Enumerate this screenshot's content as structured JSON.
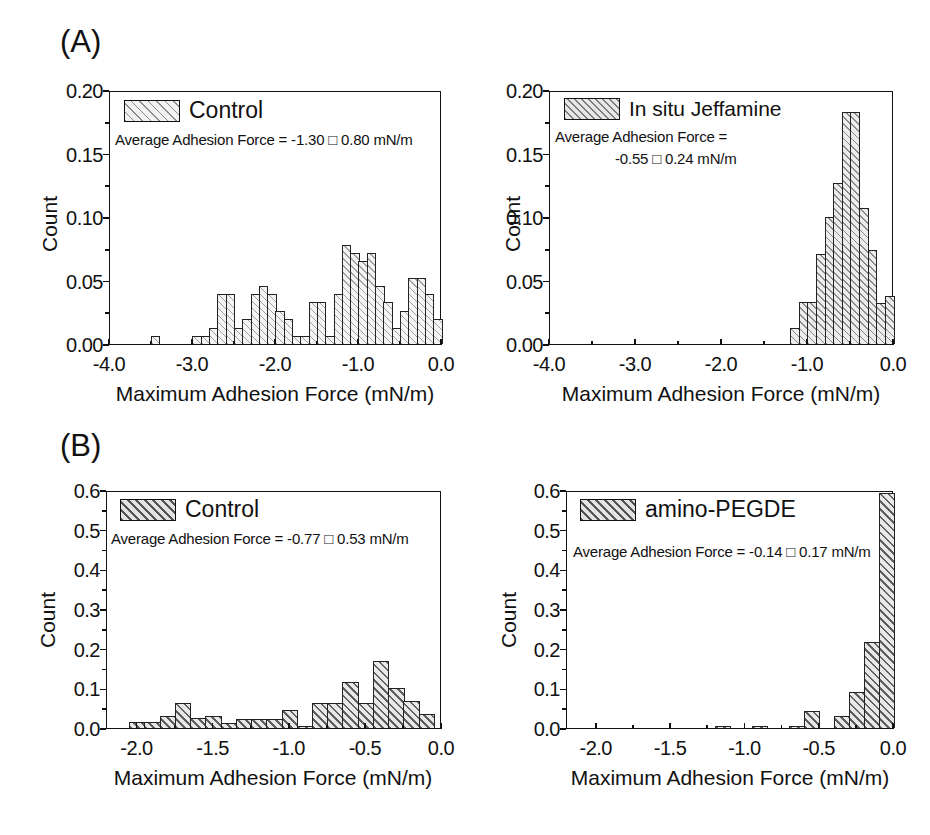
{
  "figure": {
    "panel_a_letter": "(A)",
    "panel_b_letter": "(B)"
  },
  "chart_data": [
    {
      "id": "a-left",
      "type": "bar",
      "title": "",
      "xlabel": "Maximum Adhesion Force (mN/m)",
      "ylabel": "Count",
      "xlim": [
        -4.0,
        0.0
      ],
      "ylim": [
        0.0,
        0.2
      ],
      "xticks": [
        "-4.0",
        "-3.0",
        "-2.0",
        "-1.0",
        "0.0"
      ],
      "xtick_values": [
        -4.0,
        -3.0,
        -2.0,
        -1.0,
        0.0
      ],
      "yticks": [
        "0.00",
        "0.05",
        "0.10",
        "0.15",
        "0.20"
      ],
      "ytick_values": [
        0.0,
        0.05,
        0.1,
        0.15,
        0.2
      ],
      "grid": false,
      "legend_position": "top-left",
      "legend": "Control",
      "annotation": "Average Adhesion Force = -1.30 □ 0.80 mN/m",
      "annotation_line2": "",
      "mean": -1.3,
      "std": 0.8,
      "bin_width": 0.1,
      "bin_left_edges": [
        -3.5,
        -3.0,
        -2.9,
        -2.8,
        -2.7,
        -2.6,
        -2.5,
        -2.4,
        -2.3,
        -2.2,
        -2.1,
        -2.0,
        -1.9,
        -1.8,
        -1.7,
        -1.6,
        -1.5,
        -1.4,
        -1.3,
        -1.2,
        -1.1,
        -1.0,
        -0.9,
        -0.8,
        -0.7,
        -0.6,
        -0.5,
        -0.4,
        -0.3,
        -0.2,
        -0.1
      ],
      "values": [
        0.006,
        0.006,
        0.006,
        0.013,
        0.039,
        0.039,
        0.013,
        0.02,
        0.039,
        0.046,
        0.039,
        0.026,
        0.02,
        0.006,
        0.006,
        0.033,
        0.033,
        0.006,
        0.039,
        0.078,
        0.072,
        0.065,
        0.072,
        0.046,
        0.033,
        0.013,
        0.026,
        0.052,
        0.052,
        0.039,
        0.02
      ]
    },
    {
      "id": "a-right",
      "type": "bar",
      "title": "",
      "xlabel": "Maximum Adhesion Force (mN/m)",
      "ylabel": "Count",
      "xlim": [
        -4.0,
        0.0
      ],
      "ylim": [
        0.0,
        0.2
      ],
      "xticks": [
        "-4.0",
        "-3.0",
        "-2.0",
        "-1.0",
        "0.0"
      ],
      "xtick_values": [
        -4.0,
        -3.0,
        -2.0,
        -1.0,
        0.0
      ],
      "yticks": [
        "0.00",
        "0.05",
        "0.10",
        "0.15",
        "0.20"
      ],
      "ytick_values": [
        0.0,
        0.05,
        0.1,
        0.15,
        0.2
      ],
      "grid": false,
      "legend_position": "top-left",
      "legend": "In situ Jeffamine",
      "annotation": "Average Adhesion Force =",
      "annotation_line2": "-0.55 □ 0.24 mN/m",
      "mean": -0.55,
      "std": 0.24,
      "bin_width": 0.1,
      "bin_left_edges": [
        -1.2,
        -1.1,
        -1.0,
        -0.9,
        -0.8,
        -0.7,
        -0.6,
        -0.5,
        -0.4,
        -0.3,
        -0.2,
        -0.1
      ],
      "values": [
        0.013,
        0.033,
        0.033,
        0.071,
        0.1,
        0.127,
        0.183,
        0.183,
        0.107,
        0.074,
        0.032,
        0.038
      ]
    },
    {
      "id": "b-left",
      "type": "bar",
      "title": "",
      "xlabel": "Maximum Adhesion Force (mN/m)",
      "ylabel": "Count",
      "xlim": [
        -2.2,
        0.0
      ],
      "ylim": [
        0.0,
        0.6
      ],
      "xticks": [
        "-2.0",
        "-1.5",
        "-1.0",
        "-0.5",
        "0.0"
      ],
      "xtick_values": [
        -2.0,
        -1.5,
        -1.0,
        -0.5,
        0.0
      ],
      "yticks": [
        "0.0",
        "0.1",
        "0.2",
        "0.3",
        "0.4",
        "0.5",
        "0.6"
      ],
      "ytick_values": [
        0.0,
        0.1,
        0.2,
        0.3,
        0.4,
        0.5,
        0.6
      ],
      "grid": false,
      "legend_position": "top-left",
      "legend": "Control",
      "annotation": "Average Adhesion Force = -0.77 □ 0.53 mN/m",
      "annotation_line2": "",
      "mean": -0.77,
      "std": 0.53,
      "bin_width": 0.1,
      "bin_left_edges": [
        -2.05,
        -1.95,
        -1.85,
        -1.75,
        -1.65,
        -1.55,
        -1.45,
        -1.35,
        -1.25,
        -1.15,
        -1.05,
        -0.95,
        -0.85,
        -0.75,
        -0.65,
        -0.55,
        -0.45,
        -0.35,
        -0.25,
        -0.15
      ],
      "values": [
        0.015,
        0.015,
        0.03,
        0.062,
        0.025,
        0.03,
        0.013,
        0.022,
        0.022,
        0.022,
        0.046,
        0.005,
        0.062,
        0.062,
        0.116,
        0.062,
        0.17,
        0.1,
        0.069,
        0.035
      ]
    },
    {
      "id": "b-right",
      "type": "bar",
      "title": "",
      "xlabel": "Maximum Adhesion Force (mN/m)",
      "ylabel": "Count",
      "xlim": [
        -2.2,
        0.0
      ],
      "ylim": [
        0.0,
        0.6
      ],
      "xticks": [
        "-2.0",
        "-1.5",
        "-1.0",
        "-0.5",
        "0.0"
      ],
      "xtick_values": [
        -2.0,
        -1.5,
        -1.0,
        -0.5,
        0.0
      ],
      "yticks": [
        "0.0",
        "0.1",
        "0.2",
        "0.3",
        "0.4",
        "0.5",
        "0.6"
      ],
      "ytick_values": [
        0.0,
        0.1,
        0.2,
        0.3,
        0.4,
        0.5,
        0.6
      ],
      "grid": false,
      "legend_position": "top-left",
      "legend": "amino-PEGDE",
      "annotation": "Average Adhesion Force = -0.14 □ 0.17 mN/m",
      "annotation_line2": "",
      "mean": -0.14,
      "std": 0.17,
      "bin_width": 0.1,
      "bin_left_edges": [
        -1.2,
        -0.95,
        -0.7,
        -0.6,
        -0.4,
        -0.3,
        -0.2,
        -0.1
      ],
      "values": [
        0.006,
        0.006,
        0.006,
        0.042,
        0.03,
        0.091,
        0.216,
        0.592
      ]
    }
  ],
  "colors": {
    "axis": "#111111",
    "bar_edge": "#222222",
    "bar_fill_light": "#f2f2f2",
    "bar_fill_dense": "#e8e8e8",
    "background": "#ffffff"
  }
}
